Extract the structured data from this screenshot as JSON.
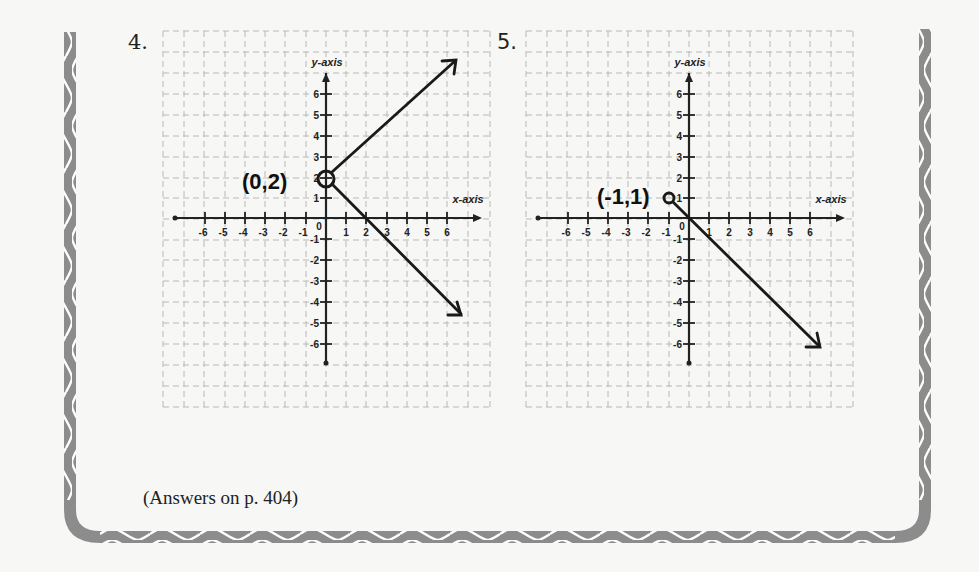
{
  "problems": [
    {
      "number": "4.",
      "axis_labels": {
        "x": "x-axis",
        "y": "y-axis"
      },
      "x_ticks": [
        "-6",
        "-5",
        "-4",
        "-3",
        "-2",
        "-1",
        "1",
        "2",
        "3",
        "4",
        "5",
        "6"
      ],
      "y_ticks": [
        "6",
        "5",
        "4",
        "3",
        "2",
        "1",
        "-1",
        "-2",
        "-3",
        "-4",
        "-5",
        "-6"
      ],
      "origin_label": "0",
      "annotation": "(0,2)",
      "vertex": [
        0,
        2
      ],
      "rays_to": [
        [
          6,
          6
        ],
        [
          6.5,
          -4.5
        ]
      ]
    },
    {
      "number": "5.",
      "axis_labels": {
        "x": "x-axis",
        "y": "y-axis"
      },
      "x_ticks": [
        "-6",
        "-5",
        "-4",
        "-3",
        "-2",
        "-1",
        "1",
        "2",
        "3",
        "4",
        "5",
        "6"
      ],
      "y_ticks": [
        "6",
        "5",
        "4",
        "3",
        "2",
        "1",
        "-1",
        "-2",
        "-3",
        "-4",
        "-5",
        "-6"
      ],
      "origin_label": "0",
      "annotation": "(-1,1)",
      "vertex": [
        -1,
        1
      ],
      "rays_to": [
        [
          6.5,
          -6.3
        ]
      ]
    }
  ],
  "footer": {
    "answers_note": "(Answers on p. 404)"
  },
  "colors": {
    "border": "#8a8a8a",
    "ink": "#1a1a1a",
    "grid": "#b5b5b5"
  }
}
